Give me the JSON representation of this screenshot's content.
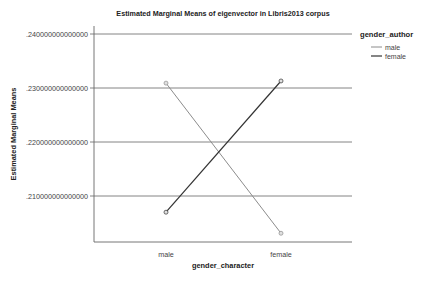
{
  "chart_data": {
    "type": "line",
    "title": "Estimated Marginal Means of eigenvector in Libris2013 corpus",
    "xlabel": "gender_character",
    "ylabel": "Estimated Marginal Means",
    "categories": [
      "male",
      "female"
    ],
    "yticks": [
      {
        "value": 0.24,
        "label": ".240000000000000"
      },
      {
        "value": 0.23,
        "label": ".230000000000000"
      },
      {
        "value": 0.22,
        "label": ".220000000000000"
      },
      {
        "value": 0.21,
        "label": ".210000000000000"
      }
    ],
    "ylim": [
      0.1985,
      0.24
    ],
    "grid": true,
    "legend": {
      "title": "gender_author",
      "position": "right",
      "entries": [
        "male",
        "female"
      ]
    },
    "series": [
      {
        "name": "male",
        "values": [
          0.2309,
          0.2031
        ],
        "color": "#8c8c8c"
      },
      {
        "name": "female",
        "values": [
          0.207,
          0.2313
        ],
        "color": "#333333"
      }
    ]
  },
  "colors": {
    "grid": "#777777",
    "axis": "#666666",
    "marker_fill": "#e0e0e0"
  }
}
